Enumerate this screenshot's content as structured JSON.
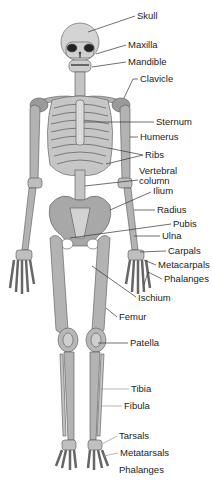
{
  "colors": {
    "bone": "#a9a9a9",
    "bone_light": "#c8c8c8",
    "outline": "#555555",
    "leader": "#333333",
    "text": "#222222"
  },
  "labels": [
    {
      "id": "skull",
      "text": "Skull",
      "x": 137,
      "y": 11
    },
    {
      "id": "maxilla",
      "text": "Maxilla",
      "x": 128,
      "y": 40
    },
    {
      "id": "mandible",
      "text": "Mandible",
      "x": 128,
      "y": 57
    },
    {
      "id": "clavicle",
      "text": "Clavicle",
      "x": 140,
      "y": 74
    },
    {
      "id": "sternum",
      "text": "Sternum",
      "x": 156,
      "y": 118
    },
    {
      "id": "humerus",
      "text": "Humerus",
      "x": 140,
      "y": 132
    },
    {
      "id": "ribs",
      "text": "Ribs",
      "x": 145,
      "y": 151
    },
    {
      "id": "vertebral-column",
      "text": "Vertebral column",
      "x": 139,
      "y": 167
    },
    {
      "id": "ilium",
      "text": "Ilium",
      "x": 153,
      "y": 187
    },
    {
      "id": "radius",
      "text": "Radius",
      "x": 157,
      "y": 205
    },
    {
      "id": "pubis",
      "text": "Pubis",
      "x": 173,
      "y": 220
    },
    {
      "id": "ulna",
      "text": "Ulna",
      "x": 162,
      "y": 231
    },
    {
      "id": "carpals",
      "text": "Carpals",
      "x": 168,
      "y": 247
    },
    {
      "id": "metacarpals",
      "text": "Metacarpals",
      "x": 158,
      "y": 261
    },
    {
      "id": "phalanges-hand",
      "text": "Phalanges",
      "x": 164,
      "y": 275
    },
    {
      "id": "ischium",
      "text": "Ischium",
      "x": 138,
      "y": 293
    },
    {
      "id": "femur",
      "text": "Femur",
      "x": 119,
      "y": 313
    },
    {
      "id": "patella",
      "text": "Patella",
      "x": 130,
      "y": 339
    },
    {
      "id": "tibia",
      "text": "Tibia",
      "x": 131,
      "y": 385
    },
    {
      "id": "fibula",
      "text": "Fibula",
      "x": 124,
      "y": 402
    },
    {
      "id": "tarsals",
      "text": "Tarsals",
      "x": 119,
      "y": 432
    },
    {
      "id": "metatarsals",
      "text": "Metatarsals",
      "x": 120,
      "y": 449
    },
    {
      "id": "phalanges-foot",
      "text": "Phalanges",
      "x": 119,
      "y": 466
    }
  ]
}
